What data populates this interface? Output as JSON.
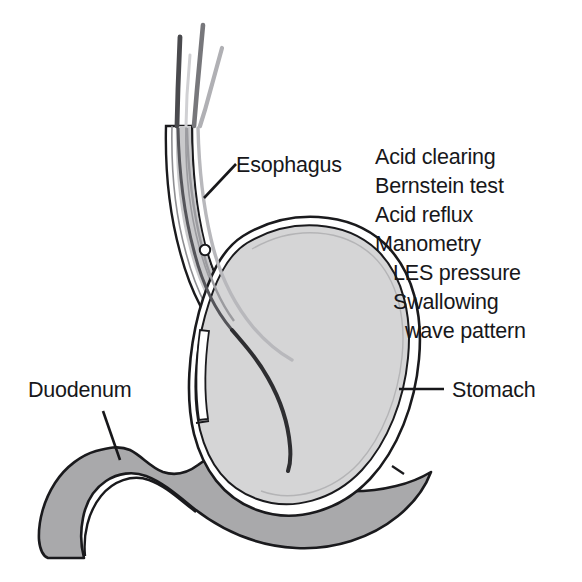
{
  "figure": {
    "background_color": "#ffffff"
  },
  "labels": [
    {
      "id": "esophagus",
      "text": "Esophagus",
      "x": 236,
      "y": 172
    },
    {
      "id": "duodenum",
      "text": "Duodenum",
      "x": 28,
      "y": 397
    },
    {
      "id": "stomach",
      "text": "Stomach",
      "x": 452,
      "y": 397
    }
  ],
  "test_list": {
    "items": [
      {
        "text": "Acid clearing",
        "x": 375,
        "y": 164,
        "indent": 0
      },
      {
        "text": "Bernstein test",
        "x": 375,
        "y": 193,
        "indent": 0
      },
      {
        "text": "Acid reflux",
        "x": 375,
        "y": 222,
        "indent": 0
      },
      {
        "text": "Manometry",
        "x": 375,
        "y": 251,
        "indent": 0
      },
      {
        "text": "LES pressure",
        "x": 393,
        "y": 280,
        "indent": 18
      },
      {
        "text": "Swallowing",
        "x": 393,
        "y": 309,
        "indent": 18
      },
      {
        "text": "wave pattern",
        "x": 405,
        "y": 338,
        "indent": 30
      }
    ]
  },
  "colors": {
    "outline": "#1a1a1d",
    "stomach_fill": "#d5d5d6",
    "stomach_wall": "#ffffff",
    "duodenum_fill": "#a9a9ab",
    "esophagus_wall": "#ffffff",
    "esophagus_shade": "#bdbdbf",
    "catheter_dark": "#3c3c3f",
    "catheter_mid": "#6e6e72",
    "catheter_light": "#a8a8ac",
    "text": "#17171a"
  },
  "anatomy": {
    "parts": [
      {
        "name": "esophagus",
        "description": "tubular esophagus descending from top, curving right into stomach cardia"
      },
      {
        "name": "stomach",
        "description": "large rounded stomach body with fundus, greater curvature and antrum"
      },
      {
        "name": "duodenum",
        "description": "C-shaped duodenal loop at lower left, darker gray"
      }
    ],
    "instruments": [
      {
        "name": "catheter-tube-dark",
        "description": "dark manometry catheter running through esophagus into stomach body"
      },
      {
        "name": "catheter-tube-mid",
        "description": "mid-gray catheter tube alongside"
      },
      {
        "name": "catheter-tube-light",
        "description": "light gray catheter tube ending in esophagus"
      },
      {
        "name": "sensor-marker",
        "description": "small circular pressure sensor marker in distal esophagus"
      }
    ]
  }
}
